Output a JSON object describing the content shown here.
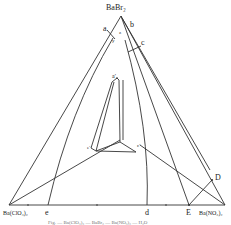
{
  "diagram": {
    "vertices": {
      "top": "BaBr₂",
      "bottom_left": "Ba(ClO₃)₂",
      "bottom_right": "Ba(NO₃)₂"
    },
    "point_labels": {
      "a": "a",
      "b": "b",
      "c": "c",
      "y": "y",
      "z": "z",
      "a_prime": "a′",
      "e_prime": "e′",
      "c_prime": "c′",
      "e": "e",
      "d": "d",
      "E": "E",
      "D": "D"
    },
    "caption": "Fig. — Ba(ClO₃)₂ — BaBr₂ — Ba(NO₃)₂ — H₂O",
    "line_color": "#333333",
    "background": "#ffffff"
  }
}
